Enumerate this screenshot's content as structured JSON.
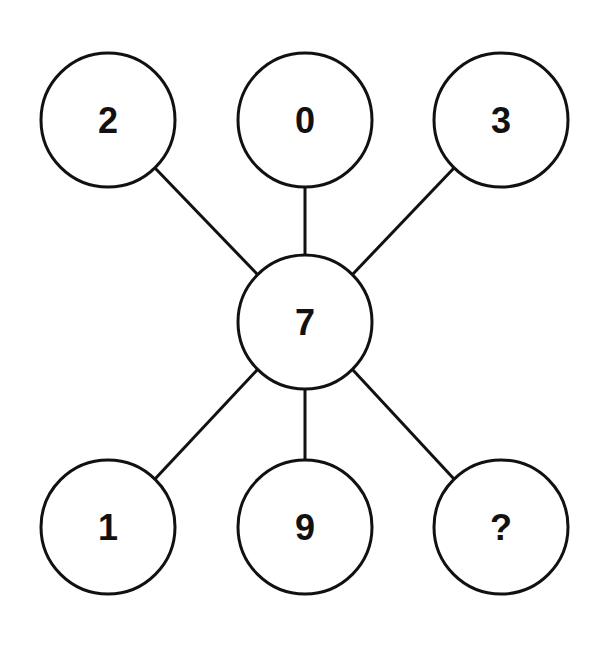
{
  "diagram": {
    "type": "number-puzzle",
    "center": {
      "label": "7",
      "cx": 305,
      "cy": 322
    },
    "nodes": [
      {
        "id": "top-left",
        "label": "2",
        "cx": 108,
        "cy": 120
      },
      {
        "id": "top-center",
        "label": "0",
        "cx": 305,
        "cy": 120
      },
      {
        "id": "top-right",
        "label": "3",
        "cx": 501,
        "cy": 120
      },
      {
        "id": "bottom-left",
        "label": "1",
        "cx": 108,
        "cy": 527
      },
      {
        "id": "bottom-center",
        "label": "9",
        "cx": 305,
        "cy": 527
      },
      {
        "id": "bottom-right",
        "label": "?",
        "cx": 501,
        "cy": 527
      }
    ],
    "radius": 67,
    "stroke_color": "#111111"
  }
}
